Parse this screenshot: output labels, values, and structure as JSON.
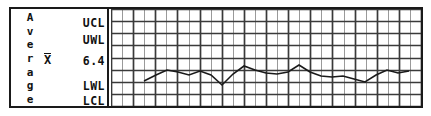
{
  "chart_title": "",
  "left_panel": {
    "axis_label": "Average",
    "axis_label_letters": [
      "A",
      "v",
      "e",
      "r",
      "a",
      "g",
      "e"
    ],
    "statistic_symbol": "X",
    "statistic_symbol_name": "x-bar",
    "limits": {
      "ucl": "UCL",
      "uwl": "UWL",
      "center": "6.4",
      "lwl": "LWL",
      "lcl": "LCL"
    }
  },
  "colors": {
    "ink": "#1a1a1a",
    "grid_major": "#3a3a3a",
    "grid_minor": "#8f8f8f",
    "data_line": "#1a1a1a",
    "background": "#ffffff"
  },
  "chart_data": {
    "type": "line",
    "title": "",
    "xlabel": "",
    "ylabel": "Average",
    "grid": true,
    "legend": "none",
    "ylim": [
      0,
      8
    ],
    "y_tick_labels": [
      "LCL",
      "LWL",
      "",
      "6.4",
      "",
      "UWL",
      "UCL"
    ],
    "center_line_label": "6.4",
    "center_line_value": 6.4,
    "x": [
      1,
      2,
      3,
      4,
      5,
      6,
      7,
      8,
      9,
      10,
      11,
      12,
      13,
      14,
      15,
      16,
      17,
      18,
      19,
      20,
      21,
      22,
      23,
      24,
      25
    ],
    "series": [
      {
        "name": "Subgroup average",
        "values": [
          6.26,
          6.38,
          6.47,
          6.42,
          6.38,
          6.45,
          6.37,
          6.16,
          6.4,
          6.55,
          6.46,
          6.41,
          6.39,
          6.42,
          6.56,
          6.42,
          6.36,
          6.34,
          6.36,
          6.28,
          6.22,
          6.37,
          6.47,
          6.4,
          6.44
        ]
      }
    ],
    "plot_geometry": {
      "grid_columns": 14,
      "grid_minor_columns_per_major": 2,
      "grid_rows": 8,
      "points_px": [
        [
          33,
          72
        ],
        [
          45,
          66
        ],
        [
          56,
          61
        ],
        [
          67,
          63
        ],
        [
          78,
          66
        ],
        [
          89,
          62
        ],
        [
          100,
          66
        ],
        [
          111,
          76
        ],
        [
          122,
          65
        ],
        [
          133,
          57
        ],
        [
          144,
          61
        ],
        [
          155,
          64
        ],
        [
          166,
          65
        ],
        [
          177,
          63
        ],
        [
          188,
          56
        ],
        [
          199,
          63
        ],
        [
          210,
          67
        ],
        [
          221,
          68
        ],
        [
          232,
          67
        ],
        [
          243,
          70
        ],
        [
          254,
          73
        ],
        [
          265,
          66
        ],
        [
          276,
          61
        ],
        [
          287,
          64
        ],
        [
          298,
          62
        ]
      ]
    }
  }
}
